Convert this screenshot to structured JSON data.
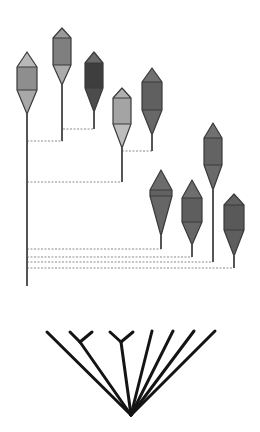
{
  "diagram": {
    "type": "spindle-phylogeny",
    "colors": {
      "background": "#ffffff",
      "stroke": "#3a3a3a",
      "stem": "#555555",
      "connector": "#8a8a8a",
      "tree_line": "#141414"
    },
    "main_axis": {
      "x": 27,
      "y_top": 114,
      "y_bottom": 286
    },
    "spindles": [
      {
        "id": "s1",
        "cx": 27,
        "top": 52,
        "bottom": 114,
        "half_width": 10,
        "shoulder_top": 67,
        "shoulder_bottom": 90,
        "fill_top": "#b8b8b8",
        "fill_mid": "#8e8e8e",
        "fill_bottom": "#a8a8a8",
        "stem_end": 120
      },
      {
        "id": "s2",
        "cx": 62,
        "top": 28,
        "bottom": 85,
        "half_width": 9,
        "shoulder_top": 38,
        "shoulder_bottom": 65,
        "fill_top": "#9a9a9a",
        "fill_mid": "#7f7f7f",
        "fill_bottom": "#ababab",
        "stem_end": 141
      },
      {
        "id": "s3",
        "cx": 94,
        "top": 52,
        "bottom": 112,
        "half_width": 9,
        "shoulder_top": 63,
        "shoulder_bottom": 88,
        "fill_top": "#6a6a6a",
        "fill_mid": "#3e3e3e",
        "fill_bottom": "#4c4c4c",
        "stem_end": 129
      },
      {
        "id": "s4",
        "cx": 122,
        "top": 88,
        "bottom": 148,
        "half_width": 9,
        "shoulder_top": 98,
        "shoulder_bottom": 124,
        "fill_top": "#b0b0b0",
        "fill_mid": "#a4a4a4",
        "fill_bottom": "#bdbdbd",
        "stem_end": 182
      },
      {
        "id": "s5",
        "cx": 152,
        "top": 68,
        "bottom": 135,
        "half_width": 10,
        "shoulder_top": 82,
        "shoulder_bottom": 110,
        "fill_top": "#707070",
        "fill_mid": "#606060",
        "fill_bottom": "#686868",
        "stem_end": 151
      },
      {
        "id": "s6",
        "cx": 161,
        "top": 170,
        "bottom": 236,
        "half_width": 11,
        "shoulder_top": 190,
        "shoulder_bottom": 196,
        "fill_top": "#6c6c6c",
        "fill_mid": "#626262",
        "fill_bottom": "#666666",
        "stem_end": 249
      },
      {
        "id": "s7",
        "cx": 192,
        "top": 180,
        "bottom": 245,
        "half_width": 10,
        "shoulder_top": 198,
        "shoulder_bottom": 222,
        "fill_top": "#6e6e6e",
        "fill_mid": "#5e5e5e",
        "fill_bottom": "#666666",
        "stem_end": 257
      },
      {
        "id": "s8",
        "cx": 213,
        "top": 123,
        "bottom": 190,
        "half_width": 9,
        "shoulder_top": 138,
        "shoulder_bottom": 165,
        "fill_top": "#707070",
        "fill_mid": "#636363",
        "fill_bottom": "#6a6a6a",
        "stem_end": 262
      },
      {
        "id": "s9",
        "cx": 234,
        "top": 194,
        "bottom": 256,
        "half_width": 10,
        "shoulder_top": 205,
        "shoulder_bottom": 230,
        "fill_top": "#616161",
        "fill_mid": "#595959",
        "fill_bottom": "#5e5e5e",
        "stem_end": 268
      }
    ],
    "connectors": [
      {
        "x1": 63,
        "x2": 94,
        "y": 129
      },
      {
        "x1": 27,
        "x2": 63,
        "y": 141
      },
      {
        "x1": 122,
        "x2": 152,
        "y": 151
      },
      {
        "x1": 27,
        "x2": 122,
        "y": 182
      },
      {
        "x1": 27,
        "x2": 161,
        "y": 249
      },
      {
        "x1": 27,
        "x2": 192,
        "y": 257
      },
      {
        "x1": 27,
        "x2": 213,
        "y": 262
      },
      {
        "x1": 27,
        "x2": 234,
        "y": 268
      }
    ],
    "cladogram": {
      "apex": {
        "x": 131,
        "y": 415
      },
      "branches": [
        {
          "tip_x": 47,
          "tip_y": 332
        },
        {
          "fork_x": 80,
          "fork_y": 342,
          "tips": [
            {
              "x": 70,
              "y": 332
            },
            {
              "x": 92,
              "y": 332
            }
          ]
        },
        {
          "fork_x": 121,
          "fork_y": 342,
          "tips": [
            {
              "x": 110,
              "y": 332
            },
            {
              "x": 133,
              "y": 332
            }
          ]
        },
        {
          "tip_x": 152,
          "tip_y": 331
        },
        {
          "tip_x": 173,
          "tip_y": 331
        },
        {
          "tip_x": 194,
          "tip_y": 331
        },
        {
          "tip_x": 215,
          "tip_y": 331
        }
      ]
    }
  }
}
